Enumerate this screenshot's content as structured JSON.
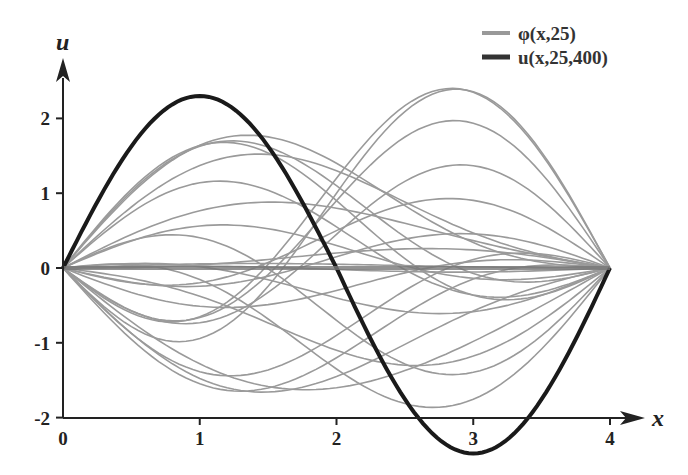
{
  "chart_data": {
    "type": "line",
    "title": "",
    "xlabel": "x",
    "ylabel": "u",
    "xlim": [
      0,
      4
    ],
    "ylim": [
      -2,
      2.5
    ],
    "x_ticks": [
      "0",
      "1",
      "2",
      "3",
      "4"
    ],
    "y_ticks": [
      "-2",
      "-1",
      "0",
      "1",
      "2"
    ],
    "grid": false,
    "legend_position": "top-right",
    "legend": [
      {
        "label": "φ(x,25)",
        "color": "#999999",
        "width": 2
      },
      {
        "label": "u(x,25,400)",
        "color": "#1a1a1a",
        "width": 4
      }
    ],
    "series": [
      {
        "name": "u(x,25,400)",
        "description": "approx 2.4·sin(πx/2), peak ≈2.3 at x≈1, min ≈-2.48 at x≈3",
        "x": [
          0,
          0.5,
          1,
          1.5,
          2,
          2.5,
          3,
          3.5,
          4
        ],
        "values": [
          0,
          1.66,
          2.3,
          1.7,
          0,
          -1.72,
          -2.48,
          -1.75,
          0
        ]
      },
      {
        "name": "φ(x,25)",
        "description": "25 sample trajectories, modeled as A·sin(πx/4)+B·sin(πx/2)",
        "params": [
          [
            1.2,
            -1.5
          ],
          [
            1.0,
            -1.65
          ],
          [
            0.9,
            -1.3
          ],
          [
            0.45,
            -1.05
          ],
          [
            0.5,
            -0.55
          ],
          [
            0.2,
            -0.1
          ],
          [
            0.05,
            0.02
          ],
          [
            -0.02,
            0.04
          ],
          [
            0.3,
            0.35
          ],
          [
            0.55,
            0.75
          ],
          [
            0.9,
            1.0
          ],
          [
            1.1,
            0.85
          ],
          [
            1.4,
            0.65
          ],
          [
            1.3,
            0.45
          ],
          [
            0.8,
            0.2
          ],
          [
            -0.3,
            -0.3
          ],
          [
            -0.9,
            -0.75
          ],
          [
            -1.2,
            -0.7
          ],
          [
            -1.45,
            -0.45
          ],
          [
            -1.6,
            -0.15
          ],
          [
            -1.1,
            0.4
          ],
          [
            -1.35,
            0.8
          ],
          [
            -0.7,
            0.9
          ],
          [
            -0.4,
            0.3
          ],
          [
            0.15,
            -0.35
          ]
        ]
      }
    ]
  }
}
